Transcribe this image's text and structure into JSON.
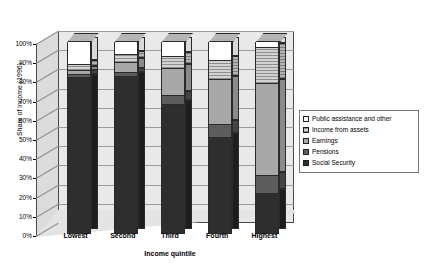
{
  "chart_data": {
    "type": "bar",
    "title": "",
    "subtitle": "",
    "xlabel": "Income quintile",
    "ylabel": "Share of income (1996)",
    "categories": [
      "Lowest",
      "Second",
      "Third",
      "Fourth",
      "Highest"
    ],
    "ylim": [
      0,
      100
    ],
    "ytick_labels": [
      "0%",
      "10%",
      "20%",
      "30%",
      "40%",
      "50%",
      "60%",
      "70%",
      "80%",
      "90%",
      "100%"
    ],
    "ytick_values": [
      0,
      10,
      20,
      30,
      40,
      50,
      60,
      70,
      80,
      90,
      100
    ],
    "grid": true,
    "stacked": true,
    "three_d": true,
    "legend_position": "right",
    "series": [
      {
        "name": "Social Security",
        "key": "social",
        "color": "#2e2e2e",
        "values": [
          81,
          82,
          67,
          50,
          21
        ]
      },
      {
        "name": "Pensions",
        "key": "pension",
        "color": "#5d5d5d",
        "values": [
          2,
          2,
          5,
          7,
          9
        ]
      },
      {
        "name": "Earnings",
        "key": "earn",
        "color": "#a8a8a8",
        "values": [
          2,
          5,
          14,
          23,
          48
        ]
      },
      {
        "name": "Income from assets",
        "key": "assets",
        "color": "#d2d2d2",
        "values": [
          3,
          4,
          6,
          10,
          19
        ]
      },
      {
        "name": "Public assistance and other",
        "key": "public",
        "color": "#ffffff",
        "values": [
          12,
          7,
          8,
          10,
          3
        ]
      }
    ]
  },
  "legend": {
    "items": [
      {
        "label": "Public assistance and other",
        "key": "public"
      },
      {
        "label": "Income from assets",
        "key": "assets"
      },
      {
        "label": "Earnings",
        "key": "earn"
      },
      {
        "label": "Pensions",
        "key": "pension"
      },
      {
        "label": "Social Security",
        "key": "social"
      }
    ]
  }
}
